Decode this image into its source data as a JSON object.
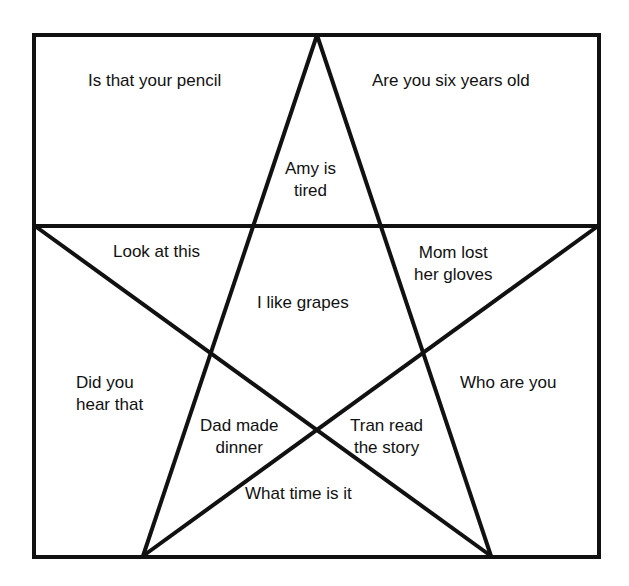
{
  "diagram": {
    "stroke_color": "#111111",
    "background_color": "#ffffff",
    "regions": [
      {
        "id": "top-left-corner",
        "text": "Is that your pencil"
      },
      {
        "id": "top-right-corner",
        "text": "Are you six years old"
      },
      {
        "id": "top-point",
        "text": "Amy is\ntired"
      },
      {
        "id": "upper-left-point",
        "text": "Look at this"
      },
      {
        "id": "upper-right-point",
        "text": "Mom lost\nher gloves"
      },
      {
        "id": "center",
        "text": "I like grapes"
      },
      {
        "id": "left-side",
        "text": "Did you\nhear that"
      },
      {
        "id": "right-side",
        "text": "Who are you"
      },
      {
        "id": "lower-left-point",
        "text": "Dad made\ndinner"
      },
      {
        "id": "lower-right-point",
        "text": "Tran read\nthe story"
      },
      {
        "id": "bottom",
        "text": "What time is it"
      }
    ]
  }
}
